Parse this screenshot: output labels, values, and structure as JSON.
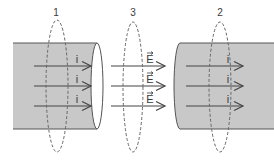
{
  "diagram": {
    "surfaces": [
      {
        "id": "1",
        "label": "1",
        "cx": 57,
        "cy": 86,
        "rx": 11,
        "ry": 66,
        "label_x": 56,
        "label_y": 16
      },
      {
        "id": "3",
        "label": "3",
        "cx": 133,
        "cy": 87,
        "rx": 10,
        "ry": 65,
        "label_x": 133,
        "label_y": 16
      },
      {
        "id": "2",
        "label": "2",
        "cx": 220,
        "cy": 87,
        "rx": 11,
        "ry": 65,
        "label_x": 220,
        "label_y": 16
      }
    ],
    "left_wire": {
      "x1": 13,
      "x2": 103,
      "y_top": 43,
      "y_bottom": 129,
      "end_rx": 6
    },
    "right_wire": {
      "x1": 174,
      "x2": 274,
      "y_top": 43,
      "y_bottom": 129,
      "end_rx": 6
    },
    "current_label": "i",
    "field_label": "E",
    "arrows_y": [
      66,
      86,
      106
    ],
    "left_arrows": {
      "x1": 34,
      "x2": 91,
      "label_x": 77
    },
    "field_arrows": {
      "x1": 111,
      "x2": 165,
      "label_x": 150
    },
    "right_arrows": {
      "x1": 186,
      "x2": 243,
      "label_x": 228
    },
    "colors": {
      "wire_fill": "#c8c8c8",
      "wire_stroke": "#555555",
      "arrow": "#444444",
      "dashed": "#666666",
      "text": "#3a3a3a"
    }
  }
}
